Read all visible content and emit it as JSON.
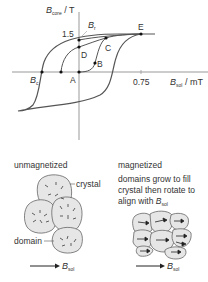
{
  "graph": {
    "y_axis_label_main": "B",
    "y_axis_label_sub": "core",
    "y_axis_label_unit": "/ T",
    "x_axis_label_main": "B",
    "x_axis_label_sub": "sol",
    "x_axis_label_unit": "/ mT",
    "y_tick": "1.5",
    "x_tick": "0.75",
    "points": {
      "A": "A",
      "B": "B",
      "C": "C",
      "D": "D",
      "E": "E",
      "Br_main": "B",
      "Br_sub": "r",
      "Bc_main": "B",
      "Bc_sub": "c"
    }
  },
  "unmagnetized": {
    "title": "unmagnetized",
    "crystal_label": "crystal",
    "domain_label": "domain",
    "arrow_main": "B",
    "arrow_sub": "sol"
  },
  "magnetized": {
    "title": "magnetized",
    "desc_line1": "domains grow to fill",
    "desc_line2": "crystal then rotate to",
    "desc_line3": "align with ",
    "desc_b": "B",
    "desc_sub": "sol",
    "arrow_main": "B",
    "arrow_sub": "sol"
  },
  "colors": {
    "line": "#555555",
    "crystal_fill": "#e6e6e6",
    "text": "#333333"
  }
}
